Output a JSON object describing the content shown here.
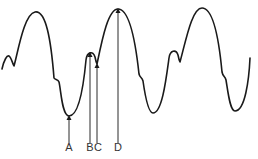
{
  "diagram": {
    "type": "waveform-with-labeled-points",
    "stroke_color": "#1a1a1a",
    "background": "#ffffff",
    "markers": [
      {
        "label": "A",
        "x": 69,
        "point_y": 116,
        "description": "trough"
      },
      {
        "label": "B",
        "x": 90,
        "point_y": 53,
        "description": "minor peak"
      },
      {
        "label": "C",
        "x": 97,
        "point_y": 64,
        "description": "notch after minor peak"
      },
      {
        "label": "D",
        "x": 118,
        "point_y": 9,
        "description": "major peak"
      }
    ],
    "labels": {
      "a": "A",
      "b": "B",
      "c": "C",
      "d": "D"
    }
  }
}
